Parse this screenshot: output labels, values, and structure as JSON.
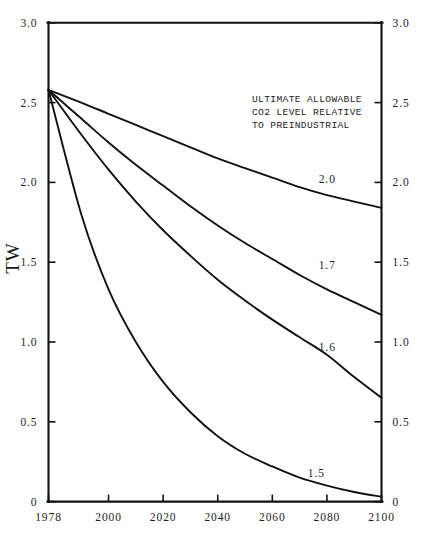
{
  "chart_data": {
    "type": "line",
    "title": "",
    "xlabel": "",
    "ylabel": "TW",
    "xlim": [
      1978,
      2100
    ],
    "ylim": [
      0,
      3.0
    ],
    "grid": false,
    "legend_position": "inline-right-of-curve",
    "x_ticks": [
      "1978",
      "2000",
      "2020",
      "2040",
      "2060",
      "2080",
      "2100"
    ],
    "x_tick_values": [
      1978,
      2000,
      2020,
      2040,
      2060,
      2080,
      2100
    ],
    "y_ticks": [
      "0",
      "0.5",
      "1.0",
      "1.5",
      "2.0",
      "2.5",
      "3.0"
    ],
    "y_tick_values": [
      0,
      0.5,
      1.0,
      1.5,
      2.0,
      2.5,
      3.0
    ],
    "y_ticks_right": [
      "0",
      "0.5",
      "1.0",
      "1.5",
      "2.0",
      "2.5",
      "3.0"
    ],
    "annotation": "ULTIMATE ALLOWABLE\nCO2 LEVEL RELATIVE\nTO PREINDUSTRIAL",
    "annotation_lines": [
      "ULTIMATE ALLOWABLE",
      "CO2 LEVEL RELATIVE",
      "TO PREINDUSTRIAL"
    ],
    "x": [
      1978,
      1990,
      2000,
      2010,
      2020,
      2030,
      2040,
      2050,
      2060,
      2070,
      2080,
      2090,
      2100
    ],
    "series": [
      {
        "name": "2.0",
        "label": "2.0",
        "label_x": 2077,
        "label_y": 2.02,
        "values": [
          2.58,
          2.5,
          2.43,
          2.36,
          2.29,
          2.22,
          2.15,
          2.09,
          2.03,
          1.97,
          1.92,
          1.88,
          1.84
        ]
      },
      {
        "name": "1.7",
        "label": "1.7",
        "label_x": 2077,
        "label_y": 1.48,
        "values": [
          2.58,
          2.4,
          2.25,
          2.11,
          1.98,
          1.85,
          1.73,
          1.62,
          1.52,
          1.42,
          1.33,
          1.25,
          1.17
        ]
      },
      {
        "name": "1.6",
        "label": "1.6",
        "label_x": 2077,
        "label_y": 0.97,
        "values": [
          2.58,
          2.3,
          2.08,
          1.88,
          1.7,
          1.54,
          1.39,
          1.26,
          1.14,
          1.03,
          0.92,
          0.78,
          0.65
        ]
      },
      {
        "name": "1.5",
        "label": "1.5",
        "label_x": 2073,
        "label_y": 0.18,
        "values": [
          2.58,
          1.8,
          1.33,
          1.0,
          0.75,
          0.56,
          0.41,
          0.3,
          0.22,
          0.15,
          0.1,
          0.06,
          0.03
        ]
      }
    ],
    "colors": {
      "line": "#111111",
      "axis": "#111111",
      "text": "#1d1d1d",
      "background": "#ffffff"
    }
  },
  "axes": {
    "y_label": "TW"
  }
}
